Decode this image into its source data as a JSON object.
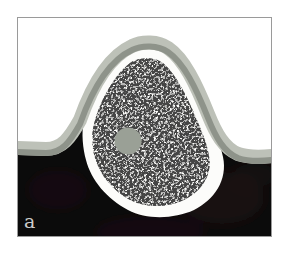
{
  "figure": {
    "label": "a",
    "colors": {
      "background": "#ffffff",
      "frame_border": "#9a9a9a",
      "dark_region": "#0b0b0b",
      "dark_blotch": "#3a191b",
      "membrane_outer": "#bdc1b8",
      "membrane_inner": "#8e938a",
      "body_fill": "#fcfcfa",
      "speckle_dark": "#101010",
      "speckle_mid": "#7a7a7a",
      "nucleus_fill": "#9aa096",
      "label_color": "#cccccc"
    }
  }
}
